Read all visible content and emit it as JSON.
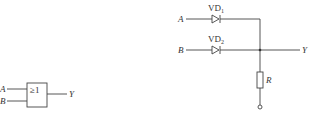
{
  "or_gate": {
    "input_a": "A",
    "input_b": "B",
    "symbol": "≥1",
    "output": "Y"
  },
  "diode_or_circuit": {
    "input_a": "A",
    "input_b": "B",
    "diode1": {
      "base": "VD",
      "sub": "1"
    },
    "diode2": {
      "base": "VD",
      "sub": "2"
    },
    "resistor": "R",
    "output": "Y"
  },
  "colors": {
    "line": "#444444",
    "background": "#ffffff"
  }
}
